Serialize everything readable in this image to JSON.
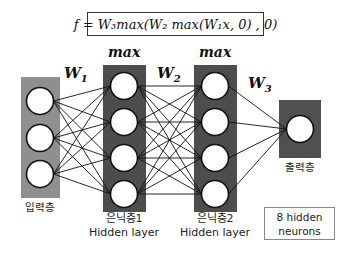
{
  "formula": "f = W₃max(W₂ max(W₁x, 0) , 0)",
  "colors": {
    "input_layer_bg": "#8f8f8f",
    "hidden_layer_bg": "#4d4d4d",
    "output_layer_bg": "#505050",
    "node_fill": "#ffffff",
    "node_stroke": "#111111",
    "edge_color": "#111111"
  },
  "layers": [
    {
      "id": "input",
      "label_ko": "입력층",
      "nodes": 3
    },
    {
      "id": "hidden1",
      "label_ko": "은닉층1",
      "label_en": "Hidden layer",
      "activation": "max",
      "nodes": 4
    },
    {
      "id": "hidden2",
      "label_ko": "은닉층2",
      "label_en": "Hidden layer",
      "activation": "max",
      "nodes": 4
    },
    {
      "id": "output",
      "label_ko": "출력층",
      "nodes": 1
    }
  ],
  "weights": {
    "w1": "W",
    "w1_sub": "1",
    "w2": "W",
    "w2_sub": "2",
    "w3": "W",
    "w3_sub": "3"
  },
  "activation_label": "max",
  "note": {
    "line1": "8 hidden",
    "line2": "neurons"
  }
}
